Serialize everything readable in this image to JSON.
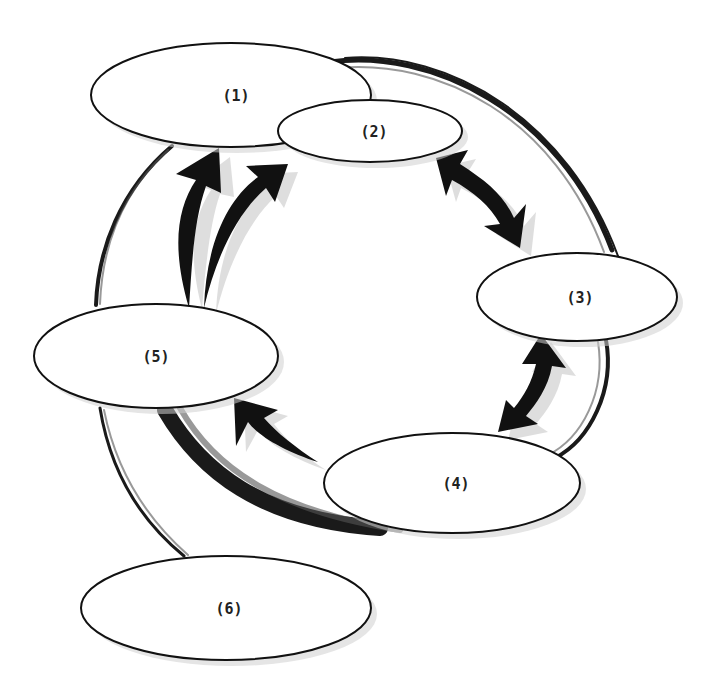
{
  "diagram": {
    "type": "cycle-diagram",
    "nodes": [
      {
        "id": "1",
        "label": "(1)",
        "cx": 231,
        "cy": 95,
        "rx": 140,
        "ry": 52
      },
      {
        "id": "2",
        "label": "(2)",
        "cx": 370,
        "cy": 131,
        "rx": 92,
        "ry": 31
      },
      {
        "id": "3",
        "label": "(3)",
        "cx": 577,
        "cy": 297,
        "rx": 100,
        "ry": 44
      },
      {
        "id": "4",
        "label": "(4)",
        "cx": 452,
        "cy": 483,
        "rx": 128,
        "ry": 50
      },
      {
        "id": "5",
        "label": "(5)",
        "cx": 156,
        "cy": 356,
        "rx": 122,
        "ry": 52
      },
      {
        "id": "6",
        "label": "(6)",
        "cx": 226,
        "cy": 608,
        "rx": 145,
        "ry": 52
      }
    ],
    "edges": [
      {
        "from": "5",
        "to": "1",
        "style": "curved-arrow"
      },
      {
        "from": "5",
        "to": "2",
        "style": "curved-arrow"
      },
      {
        "from": "2",
        "to": "3",
        "style": "double-headed-arrow"
      },
      {
        "from": "3",
        "to": "4",
        "style": "double-headed-arrow"
      },
      {
        "from": "4",
        "to": "5",
        "style": "curved-arrow"
      }
    ],
    "background_stroke": "hand-drawn brush circle connecting nodes, with tail to (6)",
    "colors": {
      "stroke": "#111111",
      "fill": "#ffffff",
      "shadow": "#cfcfcf"
    }
  }
}
